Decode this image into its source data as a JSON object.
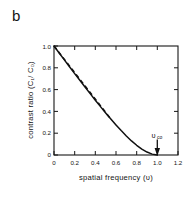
{
  "panel": {
    "label": "b"
  },
  "chart_data": {
    "type": "line",
    "title": "",
    "xlabel": "spatial  frequency  (υ)",
    "ylabel": "contrast  ratio (C₁/ C₀)",
    "xlim": [
      0,
      1.2
    ],
    "ylim": [
      0,
      1.0
    ],
    "grid": false,
    "legend": null,
    "xticks": [
      0,
      0.2,
      0.4,
      0.6,
      0.8,
      1.0,
      1.2
    ],
    "xticklabels": [
      "0",
      "0.2",
      "0.4",
      "0.6",
      "0.8",
      "1.0",
      "1.2"
    ],
    "yticks": [
      0,
      0.2,
      0.4,
      0.6,
      0.8,
      1.0
    ],
    "yticklabels": [
      "0",
      "0.2",
      "0.4",
      "0.6",
      "0.8",
      "1.0"
    ],
    "series": [
      {
        "name": "mtf-solid",
        "style": "solid",
        "x": [
          0.0,
          0.05,
          0.1,
          0.15,
          0.2,
          0.25,
          0.3,
          0.35,
          0.4,
          0.45,
          0.5,
          0.55,
          0.6,
          0.65,
          0.7,
          0.75,
          0.8,
          0.85,
          0.9,
          0.95,
          1.0
        ],
        "y": [
          1.0,
          0.936,
          0.873,
          0.81,
          0.747,
          0.685,
          0.624,
          0.563,
          0.503,
          0.444,
          0.386,
          0.33,
          0.276,
          0.224,
          0.175,
          0.129,
          0.089,
          0.054,
          0.027,
          0.008,
          0.0
        ]
      },
      {
        "name": "linear-dashed",
        "style": "dashed",
        "x": [
          0.0,
          0.55
        ],
        "y": [
          1.0,
          0.33
        ]
      }
    ],
    "annotations": [
      {
        "name": "cutoff-frequency",
        "text": "υ",
        "subscript": "co",
        "x": 1.0,
        "y": 0.0,
        "arrow": "down"
      }
    ]
  }
}
